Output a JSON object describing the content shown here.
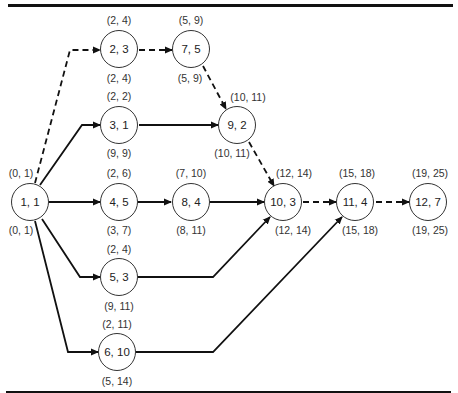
{
  "diagram": {
    "type": "network-activity-diagram",
    "nodes": [
      {
        "id": "1",
        "label": "1, 1",
        "top": "(0, 1)",
        "bottom": "(0, 1)"
      },
      {
        "id": "2",
        "label": "2, 3",
        "top": "(2, 4)",
        "bottom": "(2, 4)"
      },
      {
        "id": "3",
        "label": "3, 1",
        "top": "(2, 2)",
        "bottom": "(9, 9)"
      },
      {
        "id": "4",
        "label": "4, 5",
        "top": "(2, 6)",
        "bottom": "(3, 7)"
      },
      {
        "id": "5",
        "label": "5, 3",
        "top": "(2, 4)",
        "bottom": "(9, 11)"
      },
      {
        "id": "6",
        "label": "6, 10",
        "top": "(2, 11)",
        "bottom": "(5, 14)"
      },
      {
        "id": "7",
        "label": "7, 5",
        "top": "(5, 9)",
        "bottom": "(5, 9)"
      },
      {
        "id": "8",
        "label": "8, 4",
        "top": "(7, 10)",
        "bottom": "(8, 11)"
      },
      {
        "id": "9",
        "label": "9, 2",
        "top": "(10, 11)",
        "bottom": "(10, 11)"
      },
      {
        "id": "10",
        "label": "10, 3",
        "top": "(12, 14)",
        "bottom": "(12, 14)"
      },
      {
        "id": "11",
        "label": "11, 4",
        "top": "(15, 18)",
        "bottom": "(15, 18)"
      },
      {
        "id": "12",
        "label": "12, 7",
        "top": "(19, 25)",
        "bottom": "(19, 25)"
      }
    ],
    "edges": [
      {
        "from": "1",
        "to": "2",
        "style": "dashed",
        "critical": true
      },
      {
        "from": "1",
        "to": "3",
        "style": "solid",
        "critical": false
      },
      {
        "from": "1",
        "to": "4",
        "style": "solid",
        "critical": false
      },
      {
        "from": "1",
        "to": "5",
        "style": "solid",
        "critical": false
      },
      {
        "from": "1",
        "to": "6",
        "style": "solid",
        "critical": false
      },
      {
        "from": "2",
        "to": "7",
        "style": "dashed",
        "critical": true
      },
      {
        "from": "7",
        "to": "9",
        "style": "dashed",
        "critical": true
      },
      {
        "from": "3",
        "to": "9",
        "style": "solid",
        "critical": false
      },
      {
        "from": "9",
        "to": "10",
        "style": "dashed",
        "critical": true
      },
      {
        "from": "4",
        "to": "8",
        "style": "solid",
        "critical": false
      },
      {
        "from": "8",
        "to": "10",
        "style": "solid",
        "critical": false
      },
      {
        "from": "5",
        "to": "10",
        "style": "solid",
        "critical": false
      },
      {
        "from": "6",
        "to": "11",
        "style": "solid",
        "critical": false
      },
      {
        "from": "10",
        "to": "11",
        "style": "dashed",
        "critical": true
      },
      {
        "from": "11",
        "to": "12",
        "style": "dashed",
        "critical": true
      }
    ],
    "colors": {
      "line": "#111111",
      "node_border": "#333333",
      "background": "#ffffff"
    }
  }
}
